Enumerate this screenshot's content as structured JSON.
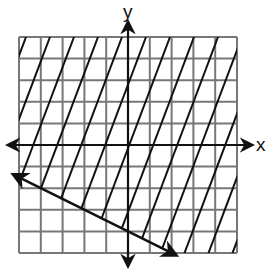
{
  "chart_data": {
    "type": "line",
    "title": "",
    "xlabel": "x",
    "ylabel": "y",
    "xlim": [
      -5,
      5
    ],
    "ylim": [
      -5,
      5
    ],
    "grid": true,
    "grid_step": 1,
    "boundary_line": {
      "equation": "y = -0.5x - 4",
      "slope": -0.5,
      "intercept": -4,
      "style": "solid",
      "arrows": "both",
      "points": [
        [
          -5,
          -1.5
        ],
        [
          2,
          -5
        ]
      ]
    },
    "shaded_region": {
      "inequality": "y >= -0.5x - 4",
      "side": "above",
      "fill": "diagonal hatching"
    }
  },
  "colors": {
    "grid": "#777777",
    "axis": "#111111",
    "line": "#111111",
    "hatch": "#111111",
    "background": "#ffffff"
  },
  "labels": {
    "x_axis": "x",
    "y_axis": "y"
  }
}
